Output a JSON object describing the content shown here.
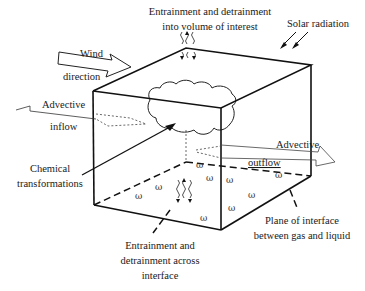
{
  "labels": {
    "entrainment_top_line1": "Entrainment and detrainment",
    "entrainment_top_line2": "into volume of interest",
    "solar_radiation": "Solar radiation",
    "wind_line1": "Wind",
    "wind_line2": "direction",
    "advective_inflow_line1": "Advective",
    "advective_inflow_line2": "inflow",
    "advective_outflow_line1": "Advective",
    "advective_outflow_line2": "outflow",
    "chemical_line1": "Chemical",
    "chemical_line2": "transformations",
    "entrainment_bottom_line1": "Entrainment and",
    "entrainment_bottom_line2": "detrainment across",
    "entrainment_bottom_line3": "interface",
    "plane_line1": "Plane of interface",
    "plane_line2": "between gas and liquid"
  },
  "colors": {
    "line": "#111111",
    "background": "#ffffff"
  }
}
